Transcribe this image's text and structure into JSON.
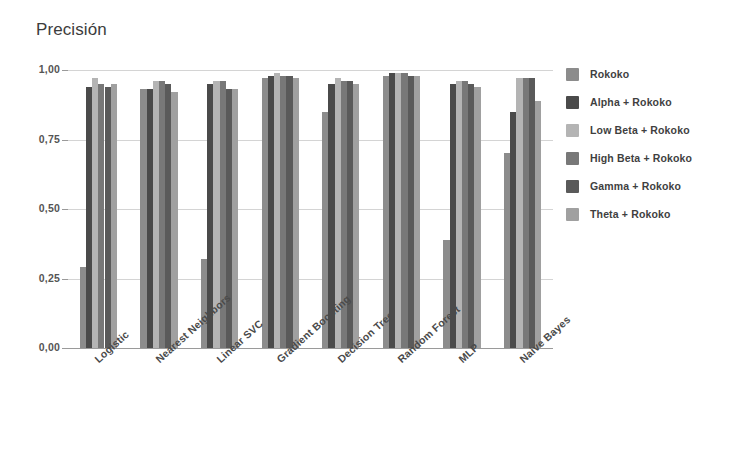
{
  "chart_data": {
    "type": "bar",
    "title": "Precisión",
    "xlabel": "",
    "ylabel": "",
    "ylim": [
      0,
      1
    ],
    "grid": true,
    "legend_position": "right",
    "ytick_labels": [
      "1,00",
      "0,75",
      "0,50",
      "0,25",
      "0,00"
    ],
    "ytick_values": [
      1.0,
      0.75,
      0.5,
      0.25,
      0.0
    ],
    "categories": [
      "Logistic",
      "Nearest Neighbors",
      "Linear SVC",
      "Gradient Boosting",
      "Decision Tree",
      "Random Forest",
      "MLP",
      "Naive Bayes"
    ],
    "series": [
      {
        "name": "Rokoko",
        "color": "#8c8c8c",
        "values": [
          0.29,
          0.93,
          0.32,
          0.97,
          0.85,
          0.98,
          0.39,
          0.7
        ]
      },
      {
        "name": "Alpha + Rokoko",
        "color": "#4a4a4a",
        "values": [
          0.94,
          0.93,
          0.95,
          0.98,
          0.95,
          0.99,
          0.95,
          0.85
        ]
      },
      {
        "name": "Low Beta + Rokoko",
        "color": "#b4b4b4",
        "values": [
          0.97,
          0.96,
          0.96,
          0.99,
          0.97,
          0.99,
          0.96,
          0.97
        ]
      },
      {
        "name": "High Beta + Rokoko",
        "color": "#787878",
        "values": [
          0.95,
          0.96,
          0.96,
          0.98,
          0.96,
          0.99,
          0.96,
          0.97
        ]
      },
      {
        "name": "Gamma + Rokoko",
        "color": "#5a5a5a",
        "values": [
          0.94,
          0.95,
          0.93,
          0.98,
          0.96,
          0.98,
          0.95,
          0.97
        ]
      },
      {
        "name": "Theta + Rokoko",
        "color": "#a0a0a0",
        "values": [
          0.95,
          0.92,
          0.93,
          0.97,
          0.95,
          0.98,
          0.94,
          0.89
        ]
      }
    ]
  },
  "legend": {
    "items": [
      {
        "label": "Rokoko"
      },
      {
        "label": "Alpha + Rokoko"
      },
      {
        "label": "Low Beta + Rokoko"
      },
      {
        "label": "High Beta + Rokoko"
      },
      {
        "label": "Gamma + Rokoko"
      },
      {
        "label": "Theta + Rokoko"
      }
    ]
  },
  "colors": {
    "gridline": "#d4d4d4",
    "axis": "#9a9a9a",
    "text": "#4a4a4a",
    "title": "#3c3c3c",
    "background": "#ffffff"
  }
}
